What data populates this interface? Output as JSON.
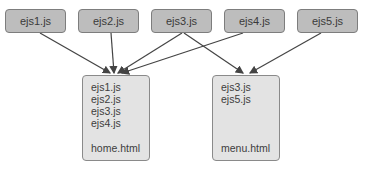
{
  "sources": [
    {
      "label": "ejs1.js"
    },
    {
      "label": "ejs2.js"
    },
    {
      "label": "ejs3.js"
    },
    {
      "label": "ejs4.js"
    },
    {
      "label": "ejs5.js"
    }
  ],
  "pages": [
    {
      "includes": [
        "ejs1.js",
        "ejs2.js",
        "ejs3.js",
        "ejs4.js"
      ],
      "filename": "home.html"
    },
    {
      "includes": [
        "ejs3.js",
        "ejs5.js"
      ],
      "filename": "menu.html"
    }
  ],
  "edges": [
    {
      "from": "ejs1.js",
      "to": "home.html"
    },
    {
      "from": "ejs2.js",
      "to": "home.html"
    },
    {
      "from": "ejs3.js",
      "to": "home.html"
    },
    {
      "from": "ejs4.js",
      "to": "home.html"
    },
    {
      "from": "ejs3.js",
      "to": "menu.html"
    },
    {
      "from": "ejs5.js",
      "to": "menu.html"
    }
  ],
  "colors": {
    "source_fill": "#bdbdbd",
    "page_fill": "#e3e3e3",
    "border": "#7d7d7d",
    "arrow": "#444444"
  }
}
